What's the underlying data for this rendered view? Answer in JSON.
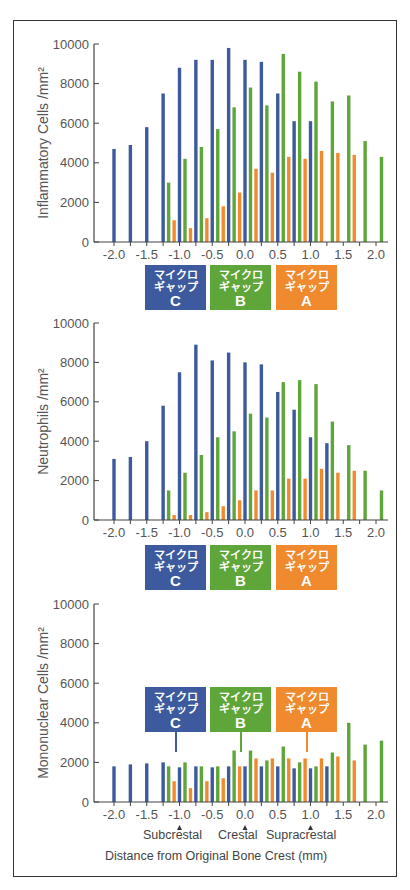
{
  "colors": {
    "C": "#3d5a9e",
    "B": "#5fa63a",
    "A": "#ef8a2e",
    "axis": "#444444",
    "text": "#555555"
  },
  "labels": {
    "C": {
      "line1": "マイクロ",
      "line2": "ギャップ",
      "letter": "C"
    },
    "B": {
      "line1": "マイクロ",
      "line2": "ギャップ",
      "letter": "B"
    },
    "A": {
      "line1": "マイクロ",
      "line2": "ギャップ",
      "letter": "A"
    }
  },
  "x_annotations": {
    "subcrestal": "Subcrestal",
    "crestal": "Crestal",
    "supracrestal": "Supracrestal"
  },
  "x_title": "Distance from Original Bone Crest (mm)",
  "chart_data": [
    {
      "type": "bar",
      "title": "",
      "ylabel": "Inflammatory Cells /mm²",
      "xlabel": "Distance from Original Bone Crest (mm)",
      "ylim": [
        0,
        10000
      ],
      "yticks": [
        0,
        2000,
        4000,
        6000,
        8000,
        10000
      ],
      "xticks": [
        "-2.0",
        "-1.5",
        "-1.0",
        "-0.5",
        "0.0",
        "0.5",
        "1.0",
        "1.5",
        "2.0"
      ],
      "grid": false,
      "legend_position": "below axis (colored label boxes)",
      "series": [
        {
          "name": "マイクロギャップ C",
          "color": "#3d5a9e",
          "x": [
            -2.0,
            -1.75,
            -1.5,
            -1.25,
            -1.0,
            -0.75,
            -0.5,
            -0.25,
            0.0,
            0.25,
            0.5,
            0.75,
            1.0
          ],
          "values": [
            4700,
            4900,
            5800,
            7500,
            8800,
            9200,
            9200,
            9800,
            9200,
            9100,
            7500,
            6100,
            6100
          ]
        },
        {
          "name": "マイクロギャップ B",
          "color": "#5fa63a",
          "x": [
            -1.25,
            -1.0,
            -0.75,
            -0.5,
            -0.25,
            0.0,
            0.25,
            0.5,
            0.75,
            1.0,
            1.25,
            1.5,
            1.75,
            2.0
          ],
          "values": [
            3000,
            4200,
            4800,
            5700,
            6800,
            7800,
            6900,
            9500,
            8600,
            8100,
            7100,
            7400,
            5100,
            4300
          ]
        },
        {
          "name": "マイクロギャップ A",
          "color": "#ef8a2e",
          "x": [
            -1.25,
            -1.0,
            -0.75,
            -0.5,
            -0.25,
            0.0,
            0.25,
            0.5,
            0.75,
            1.0,
            1.25,
            1.5
          ],
          "values": [
            1100,
            700,
            1200,
            1800,
            2500,
            3700,
            3500,
            4300,
            4200,
            4600,
            4500,
            4400
          ]
        }
      ]
    },
    {
      "type": "bar",
      "title": "",
      "ylabel": "Neutrophils /mm²",
      "xlabel": "",
      "ylim": [
        0,
        10000
      ],
      "yticks": [
        0,
        2000,
        4000,
        6000,
        8000,
        10000
      ],
      "xticks": [
        "-2.0",
        "-1.5",
        "-1.0",
        "-0.5",
        "0.0",
        "0.5",
        "1.0",
        "1.5",
        "2.0"
      ],
      "grid": false,
      "legend_position": "below axis (colored label boxes)",
      "series": [
        {
          "name": "マイクロギャップ C",
          "color": "#3d5a9e",
          "x": [
            -2.0,
            -1.75,
            -1.5,
            -1.25,
            -1.0,
            -0.75,
            -0.5,
            -0.25,
            0.0,
            0.25,
            0.5,
            0.75,
            1.0,
            1.25
          ],
          "values": [
            3100,
            3200,
            4000,
            5800,
            7500,
            8900,
            8100,
            8500,
            8000,
            7900,
            6500,
            5600,
            4200,
            3900
          ]
        },
        {
          "name": "マイクロギャップ B",
          "color": "#5fa63a",
          "x": [
            -1.25,
            -1.0,
            -0.75,
            -0.5,
            -0.25,
            0.0,
            0.25,
            0.5,
            0.75,
            1.0,
            1.25,
            1.5,
            1.75,
            2.0
          ],
          "values": [
            1500,
            2400,
            3300,
            4200,
            4500,
            5400,
            5200,
            7000,
            7100,
            6900,
            5000,
            3800,
            2500,
            1500
          ]
        },
        {
          "name": "マイクロギャップ A",
          "color": "#ef8a2e",
          "x": [
            -1.25,
            -1.0,
            -0.75,
            -0.5,
            -0.25,
            0.0,
            0.25,
            0.5,
            0.75,
            1.0,
            1.25,
            1.5
          ],
          "values": [
            250,
            250,
            400,
            700,
            1000,
            1500,
            1500,
            2100,
            2100,
            2600,
            2400,
            2500
          ]
        }
      ]
    },
    {
      "type": "bar",
      "title": "",
      "ylabel": "Mononuclear Cells /mm²",
      "xlabel": "Distance from Original Bone Crest (mm)",
      "ylim": [
        0,
        10000
      ],
      "yticks": [
        0,
        2000,
        4000,
        6000,
        8000,
        10000
      ],
      "xticks": [
        "-2.0",
        "-1.5",
        "-1.0",
        "-0.5",
        "0.0",
        "0.5",
        "1.0",
        "1.5",
        "2.0"
      ],
      "annotations": [
        {
          "x": -1.0,
          "text": "Subcrestal"
        },
        {
          "x": 0.0,
          "text": "Crestal"
        },
        {
          "x": 1.0,
          "text": "Supracrestal"
        }
      ],
      "grid": false,
      "legend_position": "inside plot (colored callout boxes)",
      "series": [
        {
          "name": "マイクロギャップ C",
          "color": "#3d5a9e",
          "x": [
            -2.0,
            -1.75,
            -1.5,
            -1.25,
            -1.0,
            -0.75,
            -0.5,
            -0.25,
            0.0,
            0.25,
            0.5,
            0.75,
            1.0,
            1.25
          ],
          "values": [
            1800,
            1900,
            1950,
            2000,
            1750,
            1800,
            1750,
            1800,
            1800,
            1800,
            1800,
            1700,
            1700,
            1800
          ]
        },
        {
          "name": "マイクロギャップ B",
          "color": "#5fa63a",
          "x": [
            -1.25,
            -1.0,
            -0.75,
            -0.5,
            -0.25,
            0.0,
            0.25,
            0.5,
            0.75,
            1.0,
            1.25,
            1.5,
            1.75,
            2.0
          ],
          "values": [
            1800,
            2000,
            1800,
            1800,
            2600,
            2600,
            2100,
            2800,
            2000,
            1800,
            2500,
            4000,
            2900,
            3100
          ]
        },
        {
          "name": "マイクロギャップ A",
          "color": "#ef8a2e",
          "x": [
            -1.25,
            -1.0,
            -0.75,
            -0.5,
            -0.25,
            0.0,
            0.25,
            0.5,
            0.75,
            1.0,
            1.25,
            1.5
          ],
          "values": [
            1050,
            700,
            1050,
            1200,
            1800,
            2200,
            2200,
            2200,
            2200,
            2200,
            2300,
            2100
          ]
        }
      ]
    }
  ]
}
